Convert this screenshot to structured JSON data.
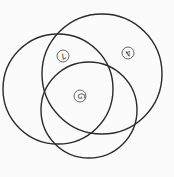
{
  "diagram": {
    "type": "venn",
    "set_count": 3,
    "sets": [
      {
        "id": "left",
        "name": "left-circle"
      },
      {
        "id": "top-right",
        "name": "top-right-circle"
      },
      {
        "id": "bottom",
        "name": "bottom-circle"
      }
    ],
    "markers": [
      {
        "id": "m1",
        "label": "7",
        "region": "left ∩ top-right",
        "rotation_deg": 150
      },
      {
        "id": "m2",
        "label": "4",
        "region": "top-right only",
        "rotation_deg": 150
      },
      {
        "id": "m3",
        "label": "G",
        "region": "left ∩ top-right ∩ bottom",
        "rotation_deg": 90
      }
    ],
    "colors": {
      "stroke": "#2a2a2a",
      "marker_stroke": "#555555",
      "background": "#fbfbfb"
    }
  }
}
